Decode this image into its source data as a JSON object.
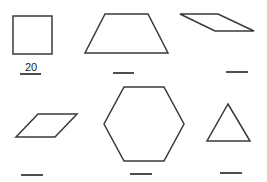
{
  "worksheet": {
    "shapes": [
      {
        "name": "square",
        "answer": "20"
      },
      {
        "name": "trapezoid",
        "answer": ""
      },
      {
        "name": "rhombus",
        "answer": ""
      },
      {
        "name": "parallelogram",
        "answer": ""
      },
      {
        "name": "hexagon",
        "answer": ""
      },
      {
        "name": "triangle",
        "answer": ""
      }
    ]
  },
  "colors": {
    "stroke": "#3a3a3a",
    "background": "#ffffff"
  }
}
